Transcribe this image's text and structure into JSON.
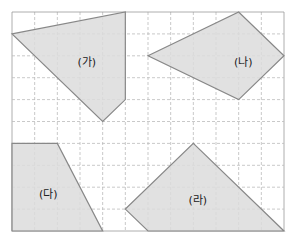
{
  "grid": {
    "x0": 12,
    "y0": 12,
    "cols": 12,
    "rows": 10,
    "cw": 22.667,
    "ch": 21.9,
    "line_color": "#bbbbbb",
    "border_color": "#999999"
  },
  "colors": {
    "fill": "#dcdcdc",
    "stroke": "#888888"
  },
  "shapes": [
    {
      "id": "ga",
      "label": "(가)",
      "points": [
        [
          0,
          1
        ],
        [
          5,
          0
        ],
        [
          5,
          4
        ],
        [
          4,
          5
        ]
      ],
      "label_pos": [
        3.3,
        2.3
      ]
    },
    {
      "id": "na",
      "label": "(나)",
      "points": [
        [
          6,
          2
        ],
        [
          10,
          0
        ],
        [
          12,
          2
        ],
        [
          10,
          4
        ]
      ],
      "label_pos": [
        10.2,
        2.3
      ]
    },
    {
      "id": "da",
      "label": "(다)",
      "points": [
        [
          0,
          6
        ],
        [
          2,
          6
        ],
        [
          4,
          10
        ],
        [
          0,
          10
        ]
      ],
      "label_pos": [
        1.6,
        8.3
      ]
    },
    {
      "id": "ra",
      "label": "(라)",
      "points": [
        [
          8,
          6
        ],
        [
          12,
          10
        ],
        [
          6,
          10
        ],
        [
          5,
          9
        ]
      ],
      "label_pos": [
        8.2,
        8.6
      ]
    }
  ]
}
